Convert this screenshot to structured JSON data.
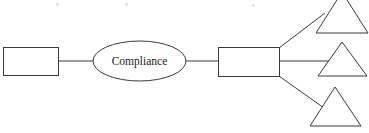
{
  "diagram": {
    "type": "flowchart",
    "background_color": "#ffffff",
    "stroke_color": "#3a3a3a",
    "text_color": "#1a1a1a",
    "canvas": {
      "width": 369,
      "height": 133
    },
    "nodes": [
      {
        "id": "input-box",
        "shape": "rectangle",
        "label": "",
        "x": 3,
        "y": 47,
        "width": 55,
        "height": 28
      },
      {
        "id": "compliance-ellipse",
        "shape": "ellipse",
        "label": "Compliance",
        "cx": 139.5,
        "cy": 61,
        "rx": 46.5,
        "ry": 20
      },
      {
        "id": "process-box",
        "shape": "rectangle",
        "label": "",
        "x": 218,
        "y": 47,
        "width": 61,
        "height": 29
      },
      {
        "id": "output-triangle-top",
        "shape": "triangle",
        "label": "",
        "apex_x": 342,
        "apex_y": -8,
        "base_left_x": 316,
        "base_right_x": 368,
        "base_y": 33
      },
      {
        "id": "output-triangle-middle",
        "shape": "triangle",
        "label": "",
        "apex_x": 342,
        "apex_y": 42,
        "base_left_x": 318,
        "base_right_x": 367,
        "base_y": 76
      },
      {
        "id": "output-triangle-bottom",
        "shape": "triangle",
        "label": "",
        "apex_x": 335,
        "apex_y": 87,
        "base_left_x": 310,
        "base_right_x": 361,
        "base_y": 126
      }
    ],
    "edges": [
      {
        "id": "edge-input-to-compliance",
        "from": "input-box",
        "to": "compliance-ellipse",
        "points": "58,61 93,61"
      },
      {
        "id": "edge-compliance-to-process",
        "from": "compliance-ellipse",
        "to": "process-box",
        "points": "186,61 218,61"
      },
      {
        "id": "edge-process-to-triangle-top",
        "from": "process-box",
        "to": "output-triangle-top",
        "points": "279,48 324,13"
      },
      {
        "id": "edge-process-to-triangle-middle",
        "from": "process-box",
        "to": "output-triangle-middle",
        "points": "279,61 330,61"
      },
      {
        "id": "edge-process-to-triangle-bottom",
        "from": "process-box",
        "to": "output-triangle-bottom",
        "points": "279,76 323,108"
      }
    ],
    "artifacts": [
      {
        "id": "speck-1",
        "x": 56,
        "y": 3
      },
      {
        "id": "speck-2",
        "x": 125,
        "y": 3
      },
      {
        "id": "speck-3",
        "x": 252,
        "y": 4
      }
    ]
  }
}
